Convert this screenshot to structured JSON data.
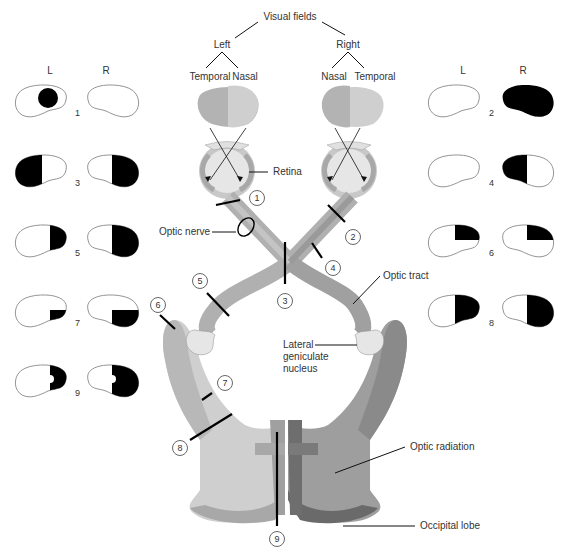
{
  "title": "Visual fields",
  "sides": {
    "left": "Left",
    "right": "Right"
  },
  "left_eye_fields": {
    "temporal": "Temporal",
    "nasal": "Nasal"
  },
  "right_eye_fields": {
    "nasal": "Nasal",
    "temporal": "Temporal"
  },
  "field_column_labels": {
    "left": "L",
    "right": "R"
  },
  "structure_labels": {
    "retina": "Retina",
    "optic_nerve": "Optic nerve",
    "optic_tract": "Optic tract",
    "lgn_line1": "Lateral",
    "lgn_line2": "geniculate",
    "lgn_line3": "nucleus",
    "optic_radiation": "Optic radiation",
    "occipital_lobe": "Occipital lobe"
  },
  "lesion_numbers": [
    "1",
    "2",
    "3",
    "4",
    "5",
    "6",
    "7",
    "8",
    "9"
  ],
  "field_defects": [
    {
      "id": "1",
      "left_eye": "central scotoma",
      "right_eye": "normal"
    },
    {
      "id": "2",
      "left_eye": "normal",
      "right_eye": "complete blindness"
    },
    {
      "id": "3",
      "left_eye": "temporal half blind",
      "right_eye": "temporal half blind"
    },
    {
      "id": "4",
      "left_eye": "normal",
      "right_eye": "nasal half blind"
    },
    {
      "id": "5",
      "left_eye": "right half blind",
      "right_eye": "right half blind"
    },
    {
      "id": "6",
      "left_eye": "upper right quadrant",
      "right_eye": "upper right quadrant"
    },
    {
      "id": "7",
      "left_eye": "lower right quadrant",
      "right_eye": "lower right quadrant"
    },
    {
      "id": "8",
      "left_eye": "right half blind",
      "right_eye": "right half blind"
    },
    {
      "id": "9",
      "left_eye": "right half blind, macular sparing",
      "right_eye": "right half blind, macular sparing"
    }
  ],
  "colors": {
    "light_gray": "#d9d9d9",
    "mid_gray": "#b3b3b3",
    "dark_gray": "#8c8c8c",
    "darkest_gray": "#6e6e6e",
    "defect": "#000000"
  }
}
